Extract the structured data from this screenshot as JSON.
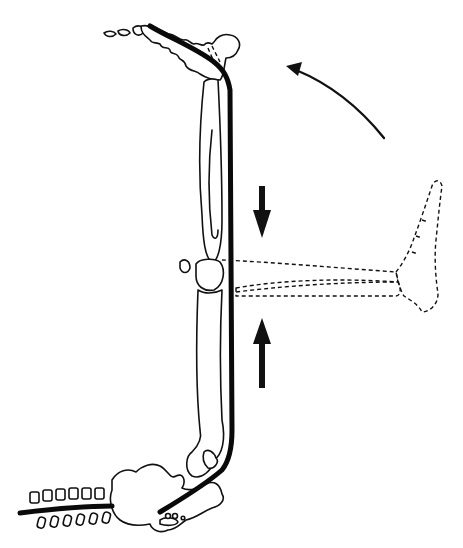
{
  "figure": {
    "kind": "anatomical-line-illustration",
    "style": "black line art on white",
    "colors": {
      "ink": "#111111",
      "background": "#ffffff"
    },
    "elements": [
      "pelvis-and-sacrum",
      "femur",
      "tibia-fibula",
      "patella",
      "foot",
      "lumbar-vertebrae",
      "nerve-path",
      "ghost-leg-dashed",
      "arrow-down",
      "arrow-up",
      "curved-rotation-arrow"
    ],
    "text_labels": []
  }
}
